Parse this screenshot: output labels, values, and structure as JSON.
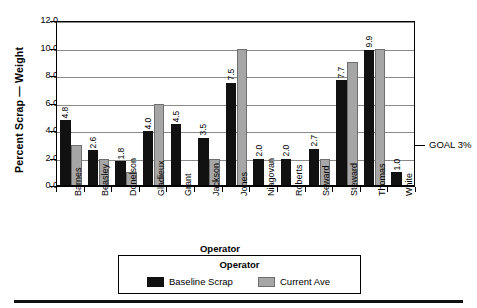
{
  "chart_data": {
    "type": "bar",
    "title": "",
    "xlabel": "Operator",
    "ylabel": "Percent Scrap — Weight",
    "ylim": [
      0,
      12
    ],
    "ytick_step": 2,
    "ytick_labels": [
      "0.0",
      "2.0",
      "4.0",
      "6.0",
      "8.0",
      "10.0",
      "12.0"
    ],
    "grid": true,
    "legend_position": "bottom-center",
    "legend_title": "Operator",
    "categories": [
      "Barnes",
      "Beasley",
      "Donelson",
      "Gladieux",
      "Grant",
      "Jackson",
      "Jones",
      "Niagovan",
      "Roberts",
      "Seward",
      "Steward",
      "Thomas",
      "White"
    ],
    "series": [
      {
        "name": "Baseline Scrap",
        "color": "#111111",
        "labels_shown": true,
        "values": [
          4.8,
          2.6,
          1.8,
          4.0,
          4.5,
          3.5,
          7.5,
          2.0,
          2.0,
          2.7,
          7.7,
          9.9,
          1.0
        ],
        "value_labels": [
          "4.8",
          "2.6",
          "1.8",
          "4.0",
          "4.5",
          "3.5",
          "7.5",
          "2.0",
          "2.0",
          "2.7",
          "7.7",
          "9.9",
          "1.0"
        ]
      },
      {
        "name": "Current Ave",
        "color": "#a6a6a6",
        "labels_shown": false,
        "values": [
          3.0,
          2.0,
          1.0,
          6.0,
          null,
          2.0,
          10.0,
          null,
          null,
          2.0,
          9.0,
          10.0,
          null
        ]
      }
    ],
    "annotations": [
      {
        "text": "GOAL 3%",
        "y": 3.0,
        "marker": "tick-right"
      }
    ]
  }
}
